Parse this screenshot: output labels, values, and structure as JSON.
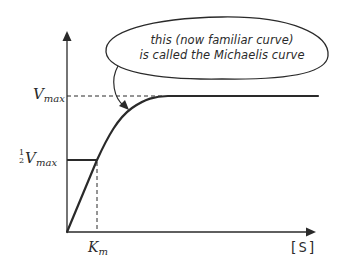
{
  "diagram": {
    "type": "michaelis-menten-saturation-curve",
    "colors": {
      "ink": "#2a2a2a",
      "background": "#ffffff"
    },
    "axes": {
      "x_label": "[S]",
      "y_label": ""
    },
    "labels": {
      "vmax": {
        "main": "V",
        "sub": "max"
      },
      "half_vmax": {
        "frac_num": "1",
        "frac_den": "2",
        "main": "V",
        "sub": "max"
      },
      "km": {
        "main": "K",
        "sub": "m"
      }
    },
    "callout": {
      "line1": "this (now familiar curve)",
      "line2": "is called the Michaelis curve"
    },
    "curve_points": [
      {
        "s": 0,
        "v": 0
      },
      {
        "s": "Km",
        "v": "1/2 Vmax"
      },
      {
        "s": "large",
        "v": "Vmax"
      }
    ]
  }
}
